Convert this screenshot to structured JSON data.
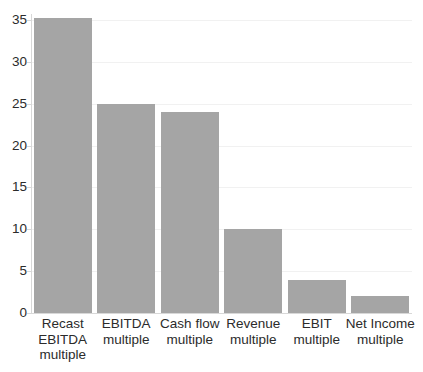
{
  "chart_data": {
    "type": "bar",
    "title": "",
    "xlabel": "",
    "ylabel": "",
    "categories": [
      "Recast EBITDA multiple",
      "EBITDA multiple",
      "Cash flow multiple",
      "Revenue multiple",
      "EBIT multiple",
      "Net Income multiple"
    ],
    "category_lines": [
      [
        "Recast",
        "EBITDA",
        "multiple"
      ],
      [
        "EBITDA",
        "multiple"
      ],
      [
        "Cash flow",
        "multiple"
      ],
      [
        "Revenue",
        "multiple"
      ],
      [
        "EBIT",
        "multiple"
      ],
      [
        "Net Income",
        "multiple"
      ]
    ],
    "values": [
      35.2,
      25,
      24,
      10,
      4,
      2
    ],
    "ylim": [
      0,
      35.2
    ],
    "yticks": [
      0,
      5,
      10,
      15,
      20,
      25,
      30,
      35
    ],
    "ytick_labels": [
      "0",
      "5",
      "10",
      "15",
      "20",
      "25",
      "30",
      "35"
    ],
    "grid": true,
    "legend": false,
    "bar_color": "#a5a5a5",
    "gridline_color": "#f1f1f1",
    "axis_color": "#d8d8d8",
    "text_color": "#2b2b2b",
    "background": "#ffffff"
  }
}
